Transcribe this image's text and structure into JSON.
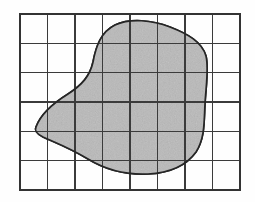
{
  "figure": {
    "background_color": "#fefefe"
  },
  "grid": {
    "name": "coordinate-grid",
    "columns": 8,
    "rows": 6,
    "cell_width": 27.5,
    "cell_height": 29.3,
    "origin_x": 20,
    "origin_y": 14,
    "width": 220,
    "height": 176,
    "line_color": "#3b3b3b",
    "frame_color": "#333333",
    "line_width": 1.15,
    "frame_width": 1.5,
    "show_grid": true
  },
  "region": {
    "name": "shaded-region",
    "fill_color": "#b9b9b9",
    "stroke_color": "#262626",
    "stroke_width": 1.7,
    "texture": "speckled-gray",
    "extent": {
      "left_x": 36,
      "right_x": 207,
      "top_y": 22,
      "bottom_y": 173
    },
    "path": "M 36 127 C 40 116, 52 104, 68 94 C 82 85, 90 76, 93 62 C 96 46, 101 32, 115 25 C 130 18, 152 20, 170 27 C 188 34, 202 42, 206 56 C 209 68, 206 86, 205 104 C 204 122, 205 138, 196 152 C 186 166, 168 173, 148 174 C 126 175, 106 170, 88 159 C 70 148, 54 142, 43 137 C 37 134, 34 131, 36 127 Z",
    "area_estimate_units": 26
  },
  "labels": {
    "axis_x": "",
    "axis_y": "",
    "caption": ""
  }
}
